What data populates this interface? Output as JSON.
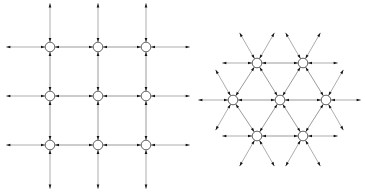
{
  "figure": {
    "background_color": "#ffffff",
    "width": 365,
    "height": 196,
    "node_fill_color": "#ffffff",
    "node_stroke_color": "#3a3a3a",
    "edge_color": "#6e6e6e",
    "stub_color": "#8a8a8a",
    "arrow_color": "#111111",
    "node_radius": 4.8,
    "arrow_length": 4.2,
    "arrow_width": 2.6,
    "panels": [
      {
        "id": "square-lattice",
        "name": "square-lattice-panel",
        "label": "Square lattice, coordination number 4",
        "lattice_type": "square",
        "coordination_number": 4,
        "arm_angles_deg": [
          0,
          90,
          180,
          270
        ],
        "node_count": 9,
        "rows": 3,
        "columns": 3,
        "spacing_x": 48,
        "spacing_y": 49,
        "origin_x": 50,
        "origin_y": 47,
        "stub_length": 39,
        "nodes": [
          {
            "id": "sq-0-0",
            "x": 50,
            "y": 47
          },
          {
            "id": "sq-0-1",
            "x": 98,
            "y": 47
          },
          {
            "id": "sq-0-2",
            "x": 146,
            "y": 47
          },
          {
            "id": "sq-1-0",
            "x": 50,
            "y": 96
          },
          {
            "id": "sq-1-1",
            "x": 98,
            "y": 96
          },
          {
            "id": "sq-1-2",
            "x": 146,
            "y": 96
          },
          {
            "id": "sq-2-0",
            "x": 50,
            "y": 145
          },
          {
            "id": "sq-2-1",
            "x": 98,
            "y": 145
          },
          {
            "id": "sq-2-2",
            "x": 146,
            "y": 145
          }
        ]
      },
      {
        "id": "triangular-lattice",
        "name": "triangular-lattice-panel",
        "label": "Triangular lattice, coordination number 6",
        "lattice_type": "triangular",
        "coordination_number": 6,
        "arm_angles_deg": [
          0,
          60,
          120,
          180,
          240,
          300
        ],
        "node_count": 7,
        "spacing": 46,
        "stub_length": 30,
        "nodes": [
          {
            "id": "tri-top-0",
            "x": 257,
            "y": 63
          },
          {
            "id": "tri-top-1",
            "x": 303,
            "y": 63
          },
          {
            "id": "tri-mid-0",
            "x": 233,
            "y": 100
          },
          {
            "id": "tri-mid-1",
            "x": 280,
            "y": 100
          },
          {
            "id": "tri-mid-2",
            "x": 326,
            "y": 100
          },
          {
            "id": "tri-bot-0",
            "x": 257,
            "y": 136
          },
          {
            "id": "tri-bot-1",
            "x": 303,
            "y": 136
          }
        ],
        "edges": [
          {
            "from": "tri-top-0",
            "to": "tri-top-1"
          },
          {
            "from": "tri-mid-0",
            "to": "tri-mid-1"
          },
          {
            "from": "tri-mid-1",
            "to": "tri-mid-2"
          },
          {
            "from": "tri-bot-0",
            "to": "tri-bot-1"
          },
          {
            "from": "tri-mid-0",
            "to": "tri-top-0"
          },
          {
            "from": "tri-top-0",
            "to": "tri-mid-1"
          },
          {
            "from": "tri-mid-1",
            "to": "tri-top-1"
          },
          {
            "from": "tri-top-1",
            "to": "tri-mid-2"
          },
          {
            "from": "tri-mid-0",
            "to": "tri-bot-0"
          },
          {
            "from": "tri-bot-0",
            "to": "tri-mid-1"
          },
          {
            "from": "tri-mid-1",
            "to": "tri-bot-1"
          },
          {
            "from": "tri-bot-1",
            "to": "tri-mid-2"
          }
        ]
      }
    ]
  }
}
